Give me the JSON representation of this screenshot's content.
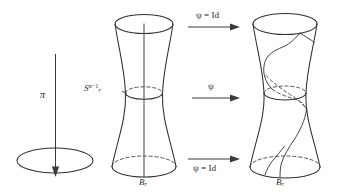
{
  "figure": {
    "title": "",
    "background_color": "#ffffff",
    "stroke_color": "#2f2f33",
    "width": 344,
    "height": 196,
    "labels": {
      "projection_map": "π",
      "sphere_label_base": "S",
      "sphere_label_sub": "r",
      "sphere_label_sup": "n−1",
      "ball_label_middle_base": "B",
      "ball_label_middle_sub": "r",
      "ball_label_right_base": "B",
      "ball_label_right_sub": "r"
    },
    "arrows": [
      {
        "name": "top-arrow",
        "label": "ψ = Id",
        "direction": "right",
        "label_position": "above"
      },
      {
        "name": "middle-arrow",
        "label": "ψ",
        "direction": "right",
        "label_position": "above"
      },
      {
        "name": "bottom-arrow",
        "label": "ψ = Id",
        "direction": "right",
        "label_position": "below"
      },
      {
        "name": "projection-arrow",
        "label": "π",
        "direction": "down",
        "label_position": "left"
      }
    ],
    "shapes": [
      {
        "name": "base-disk-ellipse",
        "type": "ellipse",
        "description": "flat horizontal ellipse representing projected base disk"
      },
      {
        "name": "middle-hourglass-solid",
        "type": "surface-of-revolution",
        "description": "hourglass solid with top rim ellipse, waist ellipse, bottom rim ellipse and a straight vertical axis fiber"
      },
      {
        "name": "right-hourglass-solid",
        "type": "surface-of-revolution",
        "description": "hourglass solid with top rim ellipse, waist ellipse, bottom rim ellipse and a twisted spiral fiber"
      }
    ]
  }
}
